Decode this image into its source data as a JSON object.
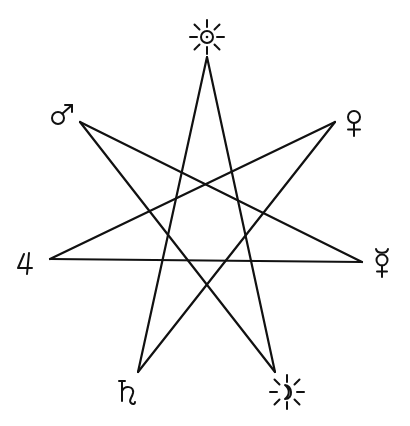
{
  "diagram": {
    "type": "heptagram {7/3}",
    "line_color": "#111111",
    "background": "#ffffff",
    "vertices": [
      {
        "id": "sun",
        "name": "Sun",
        "symbol": "☉",
        "x": 207,
        "y": 57
      },
      {
        "id": "venus",
        "name": "Venus",
        "symbol": "♀",
        "x": 335,
        "y": 122
      },
      {
        "id": "mercury",
        "name": "Mercury",
        "symbol": "☿",
        "x": 362,
        "y": 262
      },
      {
        "id": "moon",
        "name": "Moon",
        "symbol": "☽",
        "x": 275,
        "y": 372
      },
      {
        "id": "saturn",
        "name": "Saturn",
        "symbol": "♄",
        "x": 138,
        "y": 372
      },
      {
        "id": "jupiter",
        "name": "Jupiter",
        "symbol": "♃",
        "x": 50,
        "y": 259
      },
      {
        "id": "mars",
        "name": "Mars",
        "symbol": "♂",
        "x": 80,
        "y": 122
      }
    ],
    "edges": [
      [
        "sun",
        "moon"
      ],
      [
        "sun",
        "saturn"
      ],
      [
        "mars",
        "mercury"
      ],
      [
        "mars",
        "moon"
      ],
      [
        "venus",
        "jupiter"
      ],
      [
        "venus",
        "saturn"
      ],
      [
        "jupiter",
        "mercury"
      ]
    ],
    "labels": {
      "sun": "☉",
      "venus": "♀",
      "mercury": "☿",
      "moon": "☽",
      "saturn": "♄",
      "jupiter": "♃",
      "mars": "♂"
    }
  }
}
